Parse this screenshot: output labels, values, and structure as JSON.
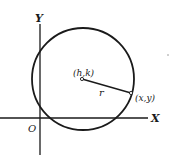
{
  "diagram": {
    "axes": {
      "x_label": "X",
      "y_label": "Y",
      "origin_label": "O"
    },
    "center_label": "(h,k)",
    "point_label": "(x,y)",
    "radius_label": "r",
    "colors": {
      "stroke": "#1a1a1a",
      "background": "#ffffff"
    }
  }
}
